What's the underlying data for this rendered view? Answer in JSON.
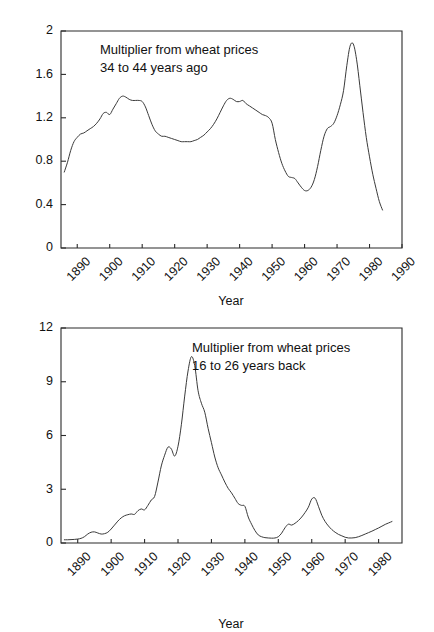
{
  "figure": {
    "background": "#ffffff",
    "line_color": "#3a3a3a",
    "axis_color": "#2b2b2b"
  },
  "panels": [
    {
      "id": "top",
      "annotation_line1": "Multiplier from wheat prices",
      "annotation_line2": "34 to 44 years ago",
      "xlabel": "Year",
      "ylabel": ""
    },
    {
      "id": "bottom",
      "annotation_line1": "Multiplier from wheat prices",
      "annotation_line2": "16 to 26 years back",
      "xlabel": "Year",
      "ylabel": ""
    }
  ],
  "chart_data": [
    {
      "type": "line",
      "title": "Multiplier from wheat prices 34 to 44 years ago",
      "xlabel": "Year",
      "ylabel": "",
      "xlim": [
        1885,
        1990
      ],
      "ylim": [
        0,
        2
      ],
      "xticks": [
        1890,
        1900,
        1910,
        1920,
        1930,
        1940,
        1950,
        1960,
        1970,
        1980,
        1990
      ],
      "yticks": [
        0,
        0.4,
        0.8,
        1.2,
        1.6,
        2
      ],
      "xticklabels": [
        "1890",
        "1900",
        "1910",
        "1920",
        "1930",
        "1940",
        "1950",
        "1960",
        "1970",
        "1980",
        "1990"
      ],
      "yticklabels": [
        "0",
        "0.4",
        "0.8",
        "1.2",
        "1.6",
        "2"
      ],
      "grid": false,
      "legend": "none",
      "annotations": [
        "Multiplier from wheat prices",
        "34 to 44 years ago"
      ],
      "series": [
        {
          "name": "multiplier_34_44",
          "x": [
            1886,
            1887,
            1888,
            1889,
            1890,
            1891,
            1892,
            1893,
            1894,
            1895,
            1896,
            1897,
            1898,
            1899,
            1900,
            1901,
            1902,
            1903,
            1904,
            1905,
            1906,
            1907,
            1908,
            1909,
            1910,
            1911,
            1912,
            1913,
            1914,
            1915,
            1916,
            1917,
            1918,
            1919,
            1920,
            1921,
            1922,
            1923,
            1924,
            1925,
            1926,
            1927,
            1928,
            1929,
            1930,
            1931,
            1932,
            1933,
            1934,
            1935,
            1936,
            1937,
            1938,
            1939,
            1940,
            1941,
            1942,
            1943,
            1944,
            1945,
            1946,
            1947,
            1948,
            1949,
            1950,
            1951,
            1952,
            1953,
            1954,
            1955,
            1956,
            1957,
            1958,
            1959,
            1960,
            1961,
            1962,
            1963,
            1964,
            1965,
            1966,
            1967,
            1968,
            1969,
            1970,
            1971,
            1972,
            1973,
            1974,
            1975,
            1976,
            1977,
            1978,
            1979,
            1980,
            1981,
            1982,
            1983,
            1984
          ],
          "y": [
            0.7,
            0.79,
            0.9,
            0.98,
            1.02,
            1.05,
            1.06,
            1.08,
            1.1,
            1.12,
            1.15,
            1.19,
            1.24,
            1.25,
            1.23,
            1.28,
            1.33,
            1.38,
            1.4,
            1.39,
            1.37,
            1.36,
            1.36,
            1.36,
            1.35,
            1.3,
            1.22,
            1.14,
            1.08,
            1.05,
            1.03,
            1.03,
            1.02,
            1.01,
            1.0,
            0.99,
            0.98,
            0.98,
            0.98,
            0.98,
            0.99,
            1.0,
            1.02,
            1.04,
            1.07,
            1.1,
            1.14,
            1.19,
            1.25,
            1.31,
            1.36,
            1.38,
            1.37,
            1.35,
            1.35,
            1.36,
            1.33,
            1.31,
            1.29,
            1.27,
            1.25,
            1.23,
            1.22,
            1.2,
            1.15,
            1.0,
            0.88,
            0.78,
            0.71,
            0.66,
            0.65,
            0.64,
            0.6,
            0.56,
            0.53,
            0.53,
            0.56,
            0.63,
            0.75,
            0.9,
            1.03,
            1.1,
            1.12,
            1.15,
            1.22,
            1.32,
            1.45,
            1.68,
            1.86,
            1.88,
            1.74,
            1.5,
            1.25,
            1.02,
            0.84,
            0.68,
            0.55,
            0.43,
            0.35,
            0.3,
            0.28
          ]
        }
      ]
    },
    {
      "type": "line",
      "title": "Multiplier from wheat prices 16 to 26 years back",
      "xlabel": "Year",
      "ylabel": "",
      "xlim": [
        1885,
        1987
      ],
      "ylim": [
        0,
        12
      ],
      "xticks": [
        1890,
        1900,
        1910,
        1920,
        1930,
        1940,
        1950,
        1960,
        1970,
        1980
      ],
      "yticks": [
        0,
        3,
        6,
        9,
        12
      ],
      "xticklabels": [
        "1890",
        "1900",
        "1910",
        "1920",
        "1930",
        "1940",
        "1950",
        "1960",
        "1970",
        "1980"
      ],
      "yticklabels": [
        "0",
        "3",
        "6",
        "9",
        "12"
      ],
      "grid": false,
      "legend": "none",
      "annotations": [
        "Multiplier from wheat prices",
        "16 to 26 years back"
      ],
      "series": [
        {
          "name": "multiplier_16_26",
          "x": [
            1886,
            1887,
            1888,
            1889,
            1890,
            1891,
            1892,
            1893,
            1894,
            1895,
            1896,
            1897,
            1898,
            1899,
            1900,
            1901,
            1902,
            1903,
            1904,
            1905,
            1906,
            1907,
            1908,
            1909,
            1910,
            1911,
            1912,
            1913,
            1914,
            1915,
            1916,
            1917,
            1918,
            1919,
            1920,
            1921,
            1922,
            1923,
            1924,
            1925,
            1926,
            1927,
            1928,
            1929,
            1930,
            1931,
            1932,
            1933,
            1934,
            1935,
            1936,
            1937,
            1938,
            1939,
            1940,
            1941,
            1942,
            1943,
            1944,
            1945,
            1946,
            1947,
            1948,
            1949,
            1950,
            1951,
            1952,
            1953,
            1954,
            1955,
            1956,
            1957,
            1958,
            1959,
            1960,
            1961,
            1962,
            1963,
            1964,
            1965,
            1966,
            1967,
            1968,
            1969,
            1970,
            1971,
            1972,
            1973,
            1974,
            1975,
            1976,
            1977,
            1978,
            1979,
            1980,
            1981,
            1982,
            1983,
            1984
          ],
          "y": [
            0.18,
            0.18,
            0.19,
            0.2,
            0.22,
            0.26,
            0.35,
            0.5,
            0.6,
            0.62,
            0.56,
            0.5,
            0.52,
            0.6,
            0.78,
            1.0,
            1.22,
            1.4,
            1.52,
            1.58,
            1.62,
            1.6,
            1.8,
            1.9,
            1.85,
            2.1,
            2.4,
            2.6,
            3.4,
            4.3,
            4.9,
            5.35,
            5.25,
            4.85,
            5.4,
            6.6,
            8.2,
            9.6,
            10.4,
            9.9,
            8.5,
            7.8,
            7.3,
            6.4,
            5.6,
            4.8,
            4.2,
            3.8,
            3.4,
            3.05,
            2.8,
            2.5,
            2.2,
            2.1,
            2.05,
            1.45,
            1.05,
            0.7,
            0.45,
            0.35,
            0.3,
            0.28,
            0.27,
            0.28,
            0.35,
            0.55,
            0.85,
            1.05,
            1.0,
            1.1,
            1.25,
            1.45,
            1.7,
            2.0,
            2.45,
            2.5,
            2.05,
            1.55,
            1.2,
            0.95,
            0.75,
            0.6,
            0.48,
            0.4,
            0.32,
            0.28,
            0.28,
            0.3,
            0.35,
            0.42,
            0.5,
            0.58,
            0.66,
            0.75,
            0.84,
            0.94,
            1.04,
            1.12,
            1.2
          ]
        }
      ]
    }
  ]
}
